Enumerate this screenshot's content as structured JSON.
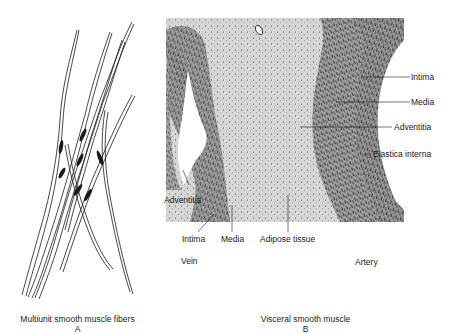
{
  "figure": {
    "panel_a": {
      "caption": "Multiunit smooth muscle fibers",
      "letter": "A"
    },
    "panel_b": {
      "caption": "Visceral smooth muscle",
      "letter": "B",
      "labels": {
        "intima_right": "Intima",
        "media_right": "Media",
        "adventitia_right": "Adventitia",
        "elastica_interna": "Elastica interna",
        "adventitia_left": "Adventitia",
        "intima_bottom": "Intima",
        "media_bottom": "Media",
        "adipose_tissue": "Adipose tissue",
        "vein": "Vein",
        "artery": "Artery"
      }
    }
  },
  "colors": {
    "background": "#ffffff",
    "tissue_light": "#d9d9d9",
    "tissue_dark": "#8c8c8c",
    "ink": "#1a1a1a",
    "fiber_fill": "#c8c8c8"
  }
}
